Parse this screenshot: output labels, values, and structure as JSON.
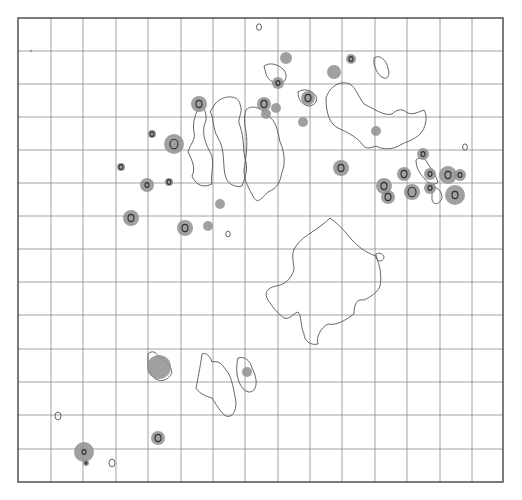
{
  "figure": {
    "background": "#ffffff",
    "frame": {
      "x": 18,
      "y": 18,
      "width": 485,
      "height": 464
    },
    "grid": {
      "columns_x": [
        51,
        83,
        116,
        148,
        181,
        213,
        245,
        278,
        310,
        342,
        375,
        407,
        440,
        472
      ],
      "rows_y": [
        51,
        84,
        117,
        150,
        183,
        216,
        249,
        282,
        315,
        349,
        382,
        415,
        449
      ],
      "color": "#8a8a8a"
    },
    "spot_color": "#8f8f8f",
    "outline_color": "#555555",
    "outlines": [
      {
        "name": "left-elongated-region",
        "d": "M 215 104 C 222 95, 238 94, 240 104 C 244 114, 236 118, 240 126 C 245 140, 242 150, 246 162 C 248 172, 244 180, 242 186 C 236 188, 228 184, 226 178 C 222 168, 226 150, 218 138 C 212 128, 214 116, 210 112 Z"
      },
      {
        "name": "left-strip-region",
        "d": "M 200 106 C 206 108, 208 118, 204 126 C 202 138, 208 148, 212 156 C 214 168, 210 178, 212 184 C 204 188, 196 186, 192 176 C 196 168, 192 160, 188 152 C 190 144, 196 140, 194 132 C 192 122, 196 112, 200 106 Z"
      },
      {
        "name": "center-elongated-region",
        "d": "M 246 110 C 252 104, 262 108, 268 116 C 276 120, 278 132, 280 142 C 284 150, 286 164, 282 172 C 280 182, 278 188, 268 192 C 262 198, 258 204, 254 198 C 250 190, 244 182, 244 170 C 246 158, 248 144, 246 132 C 244 122, 244 116, 246 110 Z"
      },
      {
        "name": "upper-right-region",
        "d": "M 326 98 C 330 86, 340 80, 350 84 C 356 88, 358 96, 364 104 C 376 110, 384 116, 392 114 C 396 110, 402 108, 406 112 C 412 116, 418 112, 424 110 C 428 116, 426 128, 420 134 C 414 140, 406 142, 402 144 C 394 150, 382 150, 376 146 C 370 148, 366 150, 362 144 C 356 136, 346 132, 338 128 C 330 124, 326 114, 326 98 Z"
      },
      {
        "name": "upper-right-small-region",
        "d": "M 374 58 C 380 54, 386 60, 388 68 C 390 74, 388 80, 384 78 C 378 76, 376 70, 374 64 Z"
      },
      {
        "name": "center-large-region",
        "d": "M 330 218 C 336 222, 344 230, 352 240 C 358 246, 364 252, 376 256 C 380 266, 382 276, 380 286 C 378 292, 372 296, 364 300 C 356 298, 354 306, 354 314 C 346 320, 336 326, 328 324 C 320 328, 316 338, 318 344 C 310 346, 304 340, 304 334 C 300 326, 302 316, 298 312 C 292 314, 290 320, 284 318 C 276 312, 272 306, 268 300 C 264 294, 266 288, 276 286 C 286 284, 290 280, 294 270 C 294 262, 290 254, 296 246 C 300 240, 306 236, 312 232 C 318 228, 324 224, 330 218 Z"
      },
      {
        "name": "center-small-blob",
        "d": "M 376 254 C 380 252, 384 254, 384 258 C 382 262, 378 262, 376 258 Z"
      },
      {
        "name": "lower-center-region",
        "d": "M 202 354 C 206 352, 210 356, 212 362 C 218 360, 222 364, 226 370 C 232 376, 234 392, 236 402 C 236 412, 232 418, 226 416 C 220 412, 216 404, 212 398 C 204 396, 198 392, 196 388 C 198 378, 200 368, 202 354 Z"
      },
      {
        "name": "lower-center-small-region",
        "d": "M 238 358 C 244 356, 250 360, 252 368 C 256 376, 258 384, 254 390 C 250 394, 244 392, 240 384 C 236 376, 236 366, 238 358 Z"
      },
      {
        "name": "lower-left-cap-region",
        "d": "M 148 354 C 152 350, 156 352, 158 356 C 164 360, 170 364, 172 372 C 170 378, 164 382, 158 380 C 152 378, 148 372, 148 364 Z"
      },
      {
        "name": "right-cluster-outline",
        "d": "M 416 160 C 420 156, 426 158, 428 164 C 432 170, 436 176, 438 182 C 434 186, 428 184, 424 178 C 420 174, 416 168, 416 160 Z"
      },
      {
        "name": "right-cluster-outline-2",
        "d": "M 432 188 C 438 186, 442 192, 442 198 C 440 204, 434 206, 432 200 Z"
      },
      {
        "name": "top-center-loop",
        "d": "M 264 66 C 270 62, 278 64, 284 70 C 288 76, 286 82, 280 84 C 274 84, 268 80, 266 74 Z"
      },
      {
        "name": "top-mid-loop",
        "d": "M 298 92 C 304 88, 312 90, 316 96 C 318 102, 314 106, 308 106 C 302 104, 298 100, 298 92 Z"
      }
    ],
    "small_rings": [
      {
        "cx": 259,
        "cy": 27,
        "r": 2.5
      },
      {
        "cx": 228,
        "cy": 234,
        "r": 2.2
      },
      {
        "cx": 465,
        "cy": 147,
        "r": 2.4
      },
      {
        "cx": 58,
        "cy": 416,
        "r": 3.0
      },
      {
        "cx": 112,
        "cy": 463,
        "r": 3.0
      }
    ],
    "spots": [
      {
        "cx": 199,
        "cy": 104,
        "r": 8,
        "core": 3
      },
      {
        "cx": 152,
        "cy": 134,
        "r": 4,
        "core": 2
      },
      {
        "cx": 174,
        "cy": 144,
        "r": 10,
        "core": 4
      },
      {
        "cx": 121,
        "cy": 167,
        "r": 4,
        "core": 2
      },
      {
        "cx": 147,
        "cy": 185,
        "r": 7,
        "core": 2
      },
      {
        "cx": 169,
        "cy": 182,
        "r": 4,
        "core": 2
      },
      {
        "cx": 220,
        "cy": 204,
        "r": 5,
        "core": 0
      },
      {
        "cx": 131,
        "cy": 218,
        "r": 8,
        "core": 3
      },
      {
        "cx": 185,
        "cy": 228,
        "r": 8,
        "core": 3
      },
      {
        "cx": 208,
        "cy": 226,
        "r": 5,
        "core": 0
      },
      {
        "cx": 286,
        "cy": 58,
        "r": 6,
        "core": 0
      },
      {
        "cx": 278,
        "cy": 83,
        "r": 6,
        "core": 2
      },
      {
        "cx": 334,
        "cy": 72,
        "r": 7,
        "core": 0
      },
      {
        "cx": 351,
        "cy": 59,
        "r": 5,
        "core": 2
      },
      {
        "cx": 264,
        "cy": 104,
        "r": 7,
        "core": 3
      },
      {
        "cx": 276,
        "cy": 108,
        "r": 5,
        "core": 0
      },
      {
        "cx": 266,
        "cy": 114,
        "r": 5,
        "core": 0
      },
      {
        "cx": 308,
        "cy": 98,
        "r": 7,
        "core": 3
      },
      {
        "cx": 303,
        "cy": 122,
        "r": 5,
        "core": 0
      },
      {
        "cx": 376,
        "cy": 131,
        "r": 5,
        "core": 0
      },
      {
        "cx": 341,
        "cy": 168,
        "r": 8,
        "core": 3
      },
      {
        "cx": 423,
        "cy": 154,
        "r": 6,
        "core": 2
      },
      {
        "cx": 404,
        "cy": 174,
        "r": 7,
        "core": 3
      },
      {
        "cx": 384,
        "cy": 186,
        "r": 8,
        "core": 3
      },
      {
        "cx": 388,
        "cy": 197,
        "r": 7,
        "core": 3
      },
      {
        "cx": 412,
        "cy": 192,
        "r": 8,
        "core": 4
      },
      {
        "cx": 430,
        "cy": 174,
        "r": 6,
        "core": 2
      },
      {
        "cx": 430,
        "cy": 188,
        "r": 6,
        "core": 2
      },
      {
        "cx": 448,
        "cy": 175,
        "r": 9,
        "core": 3
      },
      {
        "cx": 460,
        "cy": 175,
        "r": 6,
        "core": 2
      },
      {
        "cx": 455,
        "cy": 195,
        "r": 10,
        "core": 3
      },
      {
        "cx": 159,
        "cy": 367,
        "r": 12,
        "core": 0
      },
      {
        "cx": 247,
        "cy": 372,
        "r": 5,
        "core": 0
      },
      {
        "cx": 158,
        "cy": 438,
        "r": 7,
        "core": 3
      },
      {
        "cx": 84,
        "cy": 452,
        "r": 10,
        "core": 2
      },
      {
        "cx": 86,
        "cy": 463,
        "r": 3,
        "core": 1
      }
    ],
    "marks": [
      {
        "cx": 31,
        "cy": 51,
        "r": 1.2
      }
    ]
  }
}
